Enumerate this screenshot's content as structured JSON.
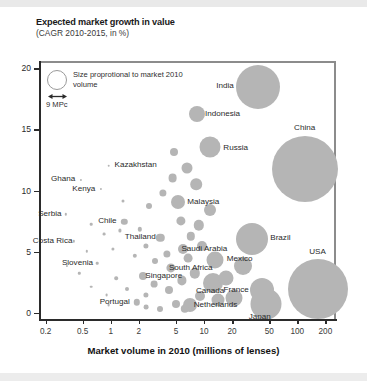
{
  "chart_data": {
    "type": "scatter",
    "title": "Expected market growth in value",
    "subtitle": "(CAGR 2010-2015, in %)",
    "xlabel": "Market volume in 2010 (millions of lenses)",
    "ylabel": "",
    "xscale": "log",
    "xlim": [
      0.17,
      260
    ],
    "ylim": [
      -0.6,
      20.6
    ],
    "grid": false,
    "legend_position": "inside-top-left",
    "xticks": [
      "0.2",
      "0.5",
      "1",
      "2",
      "5",
      "10",
      "20",
      "50",
      "100",
      "200"
    ],
    "xtick_values": [
      0.2,
      0.5,
      1,
      2,
      5,
      10,
      20,
      50,
      100,
      200
    ],
    "yticks": [
      "0",
      "5",
      "10",
      "15",
      "20"
    ],
    "ytick_values": [
      0,
      5,
      10,
      15,
      20
    ],
    "size_note": "Size proprotional to market 2010 volume",
    "size_unit": "9 MPc",
    "bubble_color": "#b5b5b5",
    "axis_color": "#2b2b2b",
    "frame_color": "#8c8c8c",
    "points": [
      {
        "name": "China",
        "x": 120,
        "y": 11.9,
        "r": 33.0,
        "label_dx": 0,
        "label_dy": -40,
        "labeled": true
      },
      {
        "name": "India",
        "x": 38,
        "y": 18.6,
        "r": 22.0,
        "label_dx": -33,
        "label_dy": 0,
        "labeled": true
      },
      {
        "name": "USA",
        "x": 165,
        "y": 2.1,
        "r": 30.0,
        "label_dx": 0,
        "label_dy": -36,
        "labeled": true
      },
      {
        "name": "Brazil",
        "x": 33,
        "y": 6.2,
        "r": 16.0,
        "label_dx": 28,
        "label_dy": 0,
        "labeled": true
      },
      {
        "name": "Japan",
        "x": 46,
        "y": 0.9,
        "r": 15.5,
        "label_dx": -6,
        "label_dy": 14,
        "labeled": true
      },
      {
        "name": "Indonesia",
        "x": 8.5,
        "y": 16.4,
        "r": 8.0,
        "label_dx": 25,
        "label_dy": 1,
        "labeled": true
      },
      {
        "name": "Russia",
        "x": 11.5,
        "y": 13.7,
        "r": 10.5,
        "label_dx": 26,
        "label_dy": 2,
        "labeled": true
      },
      {
        "name": "Malaysia",
        "x": 5.3,
        "y": 9.2,
        "r": 7.0,
        "label_dx": 25,
        "label_dy": 1,
        "labeled": true
      },
      {
        "name": "Mexico",
        "x": 13.0,
        "y": 4.5,
        "r": 8.5,
        "label_dx": 25,
        "label_dy": 0,
        "labeled": true
      },
      {
        "name": "Canada",
        "x": 12.5,
        "y": 2.6,
        "r": 10.0,
        "label_dx": -3,
        "label_dy": 9,
        "labeled": true
      },
      {
        "name": "France",
        "x": 42,
        "y": 2.0,
        "r": 12.0,
        "label_dx": -26,
        "label_dy": 1,
        "labeled": true
      },
      {
        "name": "Netherlands",
        "x": 7.0,
        "y": 0.8,
        "r": 7.0,
        "label_dx": 26,
        "label_dy": 1,
        "labeled": true
      },
      {
        "name": "Saudi Arabia",
        "x": 6.0,
        "y": 5.4,
        "r": 5.0,
        "label_dx": 21,
        "label_dy": 1,
        "labeled": true
      },
      {
        "name": "South Africa",
        "x": 4.4,
        "y": 3.8,
        "r": 4.6,
        "label_dx": 20,
        "label_dy": 1,
        "labeled": true
      },
      {
        "name": "Thailand",
        "x": 3.4,
        "y": 6.3,
        "r": 4.2,
        "label_dx": -20,
        "label_dy": 0,
        "labeled": true
      },
      {
        "name": "Singapore",
        "x": 2.2,
        "y": 3.2,
        "r": 4.0,
        "label_dx": 21,
        "label_dy": 1,
        "labeled": true
      },
      {
        "name": "Chile",
        "x": 1.4,
        "y": 7.6,
        "r": 3.2,
        "label_dx": -17,
        "label_dy": 0,
        "labeled": true
      },
      {
        "name": "Portugal",
        "x": 1.9,
        "y": 1.0,
        "r": 3.2,
        "label_dx": -22,
        "label_dy": 1,
        "labeled": true
      },
      {
        "name": "Kazakhstan",
        "x": 0.95,
        "y": 12.2,
        "r": 1.3,
        "label_dx": 27,
        "label_dy": 0,
        "labeled": true
      },
      {
        "name": "Ghana",
        "x": 0.48,
        "y": 11.0,
        "r": 1.1,
        "label_dx": -18,
        "label_dy": 0,
        "labeled": true
      },
      {
        "name": "Kenya",
        "x": 0.78,
        "y": 10.3,
        "r": 1.1,
        "label_dx": -17,
        "label_dy": 1,
        "labeled": true
      },
      {
        "name": "Serbia",
        "x": 0.33,
        "y": 8.2,
        "r": 1.2,
        "label_dx": -16,
        "label_dy": 1,
        "labeled": true
      },
      {
        "name": "Costa Rica",
        "x": 0.4,
        "y": 6.0,
        "r": 1.2,
        "label_dx": -21,
        "label_dy": 1,
        "labeled": true
      },
      {
        "name": "Slovenia",
        "x": 0.72,
        "y": 4.2,
        "r": 1.3,
        "label_dx": -20,
        "label_dy": 1,
        "labeled": true
      },
      {
        "name": "",
        "x": 6.6,
        "y": 12.0,
        "r": 5.5,
        "labeled": false
      },
      {
        "name": "",
        "x": 4.6,
        "y": 11.2,
        "r": 4.4,
        "labeled": false
      },
      {
        "name": "",
        "x": 3.6,
        "y": 10.0,
        "r": 3.6,
        "labeled": false
      },
      {
        "name": "",
        "x": 2.6,
        "y": 8.9,
        "r": 3.0,
        "labeled": false
      },
      {
        "name": "",
        "x": 8.2,
        "y": 10.7,
        "r": 5.8,
        "labeled": false
      },
      {
        "name": "",
        "x": 5.6,
        "y": 7.7,
        "r": 4.6,
        "labeled": false
      },
      {
        "name": "",
        "x": 8.8,
        "y": 7.3,
        "r": 5.2,
        "labeled": false
      },
      {
        "name": "",
        "x": 7.2,
        "y": 6.4,
        "r": 4.2,
        "labeled": false
      },
      {
        "name": "",
        "x": 9.6,
        "y": 5.6,
        "r": 5.0,
        "labeled": false
      },
      {
        "name": "",
        "x": 6.8,
        "y": 4.6,
        "r": 4.4,
        "labeled": false
      },
      {
        "name": "",
        "x": 4.0,
        "y": 5.0,
        "r": 3.6,
        "labeled": false
      },
      {
        "name": "",
        "x": 3.0,
        "y": 4.4,
        "r": 3.0,
        "labeled": false
      },
      {
        "name": "",
        "x": 2.4,
        "y": 5.6,
        "r": 2.6,
        "labeled": false
      },
      {
        "name": "",
        "x": 1.8,
        "y": 4.8,
        "r": 2.2,
        "labeled": false
      },
      {
        "name": "",
        "x": 2.9,
        "y": 2.5,
        "r": 3.4,
        "labeled": false
      },
      {
        "name": "",
        "x": 4.2,
        "y": 2.0,
        "r": 4.0,
        "labeled": false
      },
      {
        "name": "",
        "x": 5.8,
        "y": 2.8,
        "r": 4.6,
        "labeled": false
      },
      {
        "name": "",
        "x": 8.0,
        "y": 3.4,
        "r": 5.2,
        "labeled": false
      },
      {
        "name": "",
        "x": 17,
        "y": 3.0,
        "r": 7.5,
        "labeled": false
      },
      {
        "name": "",
        "x": 21,
        "y": 1.4,
        "r": 8.5,
        "labeled": false
      },
      {
        "name": "",
        "x": 14,
        "y": 1.2,
        "r": 6.5,
        "labeled": false
      },
      {
        "name": "",
        "x": 9.0,
        "y": 1.5,
        "r": 5.0,
        "labeled": false
      },
      {
        "name": "",
        "x": 5.0,
        "y": 0.9,
        "r": 4.0,
        "labeled": false
      },
      {
        "name": "",
        "x": 3.4,
        "y": 0.5,
        "r": 3.0,
        "labeled": false
      },
      {
        "name": "",
        "x": 2.4,
        "y": 1.6,
        "r": 2.6,
        "labeled": false
      },
      {
        "name": "",
        "x": 1.5,
        "y": 2.1,
        "r": 2.0,
        "labeled": false
      },
      {
        "name": "",
        "x": 1.15,
        "y": 3.0,
        "r": 1.8,
        "labeled": false
      },
      {
        "name": "",
        "x": 1.05,
        "y": 5.4,
        "r": 1.6,
        "labeled": false
      },
      {
        "name": "",
        "x": 0.85,
        "y": 6.6,
        "r": 1.4,
        "labeled": false
      },
      {
        "name": "",
        "x": 0.62,
        "y": 7.4,
        "r": 1.3,
        "labeled": false
      },
      {
        "name": "",
        "x": 0.55,
        "y": 5.2,
        "r": 1.2,
        "labeled": false
      },
      {
        "name": "",
        "x": 0.46,
        "y": 3.4,
        "r": 1.2,
        "labeled": false
      },
      {
        "name": "",
        "x": 0.62,
        "y": 2.3,
        "r": 1.3,
        "labeled": false
      },
      {
        "name": "",
        "x": 0.9,
        "y": 1.6,
        "r": 1.4,
        "labeled": false
      },
      {
        "name": "",
        "x": 1.25,
        "y": 6.9,
        "r": 1.6,
        "labeled": false
      },
      {
        "name": "",
        "x": 0.34,
        "y": 4.0,
        "r": 1.1,
        "labeled": false
      },
      {
        "name": "",
        "x": 1.35,
        "y": 9.3,
        "r": 1.5,
        "labeled": false
      },
      {
        "name": "",
        "x": 2.05,
        "y": 7.0,
        "r": 2.2,
        "labeled": false
      },
      {
        "name": "",
        "x": 11.5,
        "y": 8.6,
        "r": 6.0,
        "labeled": false
      },
      {
        "name": "",
        "x": 4.8,
        "y": 13.3,
        "r": 4.0,
        "labeled": false
      },
      {
        "name": "",
        "x": 2.4,
        "y": 0.6,
        "r": 2.4,
        "labeled": false
      },
      {
        "name": "",
        "x": 6.2,
        "y": 0.5,
        "r": 4.2,
        "labeled": false
      },
      {
        "name": "",
        "x": 26,
        "y": 4.0,
        "r": 9.0,
        "labeled": false
      },
      {
        "name": "",
        "x": 0.95,
        "y": 0.8,
        "r": 1.4,
        "labeled": false
      }
    ]
  }
}
